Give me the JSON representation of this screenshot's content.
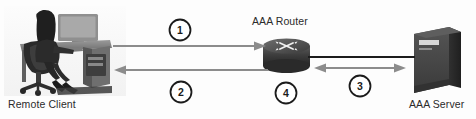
{
  "diagram": {
    "width": 476,
    "height": 119,
    "background_color": "#fdfdfd",
    "nodes": [
      {
        "id": "remote-client",
        "label": "Remote Client",
        "icon": "person-at-desk-photo",
        "label_x": 8,
        "label_y": 98
      },
      {
        "id": "aaa-router",
        "label": "AAA Router",
        "icon": "router-icon",
        "label_x": 252,
        "label_y": 16
      },
      {
        "id": "aaa-server",
        "label": "AAA Server",
        "icon": "server-icon",
        "label_x": 410,
        "label_y": 98
      }
    ],
    "connections": [
      {
        "id": "client-to-router",
        "label": "1",
        "direction": "right",
        "from": "remote-client",
        "to": "aaa-router",
        "color": "#8c8c8c"
      },
      {
        "id": "router-to-client",
        "label": "2",
        "direction": "left",
        "from": "aaa-router",
        "to": "remote-client",
        "color": "#8c8c8c"
      },
      {
        "id": "router-server-exchange",
        "label": "3",
        "direction": "both",
        "from": "aaa-router",
        "to": "aaa-server",
        "color": "#8c8c8c"
      },
      {
        "id": "router-step",
        "label": "4",
        "direction": "none",
        "from": "aaa-router",
        "to": "aaa-router",
        "color": "#8c8c8c"
      }
    ],
    "step_markers": [
      {
        "id": "step-1",
        "label": "1",
        "cx": 180,
        "cy": 30,
        "r": 11
      },
      {
        "id": "step-2",
        "label": "2",
        "cx": 181,
        "cy": 92,
        "r": 11
      },
      {
        "id": "step-3",
        "label": "3",
        "cx": 360,
        "cy": 86,
        "r": 11
      },
      {
        "id": "step-4",
        "label": "4",
        "cx": 286,
        "cy": 93,
        "r": 11
      }
    ],
    "link_line": {
      "id": "router-server-link",
      "color": "#1c1c1c",
      "x1": 310,
      "x2": 414,
      "y": 57
    },
    "colors": {
      "arrow": "#8c8c8c",
      "link": "#1c1c1c",
      "text": "#2b2b2b",
      "circle_stroke": "#1b1b1b",
      "router_dark": "#3a3a3a",
      "router_light": "#6d6d6d",
      "server_face": "#4a4a4a",
      "server_side": "#2e2e2e",
      "server_top": "#5e5e5e"
    }
  }
}
